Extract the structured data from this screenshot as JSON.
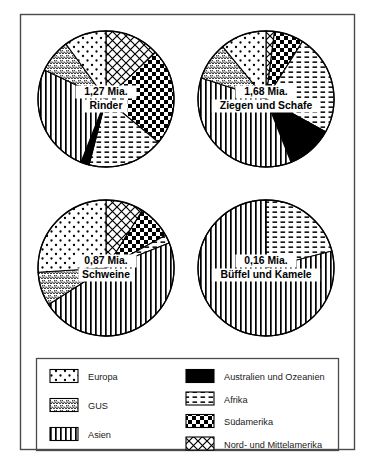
{
  "figure": {
    "unit_note": "Mia."
  },
  "chart_data": {
    "type": "pie",
    "legend_position": "bottom",
    "legend": [
      {
        "key": "europa",
        "label": "Europa",
        "pattern": "sparse-dots"
      },
      {
        "key": "gus",
        "label": "GUS",
        "pattern": "dense-scales"
      },
      {
        "key": "asien",
        "label": "Asien",
        "pattern": "vertical-lines"
      },
      {
        "key": "australien",
        "label": "Australien und Ozeanien",
        "pattern": "solid-black"
      },
      {
        "key": "afrika",
        "label": "Afrika",
        "pattern": "horizontal-dashes"
      },
      {
        "key": "suedamerika",
        "label": "Südamerika",
        "pattern": "checkerboard"
      },
      {
        "key": "nordamerika",
        "label": "Nord- und Mittelamerika",
        "pattern": "diagonal-crosshatch"
      }
    ],
    "charts": [
      {
        "id": "rinder",
        "value_label": "1,27 Mia.",
        "name_label": "Rinder",
        "value": 1.27,
        "categories": [
          "Nord- und Mittelamerika",
          "Südamerika",
          "Afrika",
          "Australien und Ozeanien",
          "Asien",
          "GUS",
          "Europa"
        ],
        "keys": [
          "nordamerika",
          "suedamerika",
          "afrika",
          "australien",
          "asien",
          "gus",
          "europa"
        ],
        "values": [
          13,
          23,
          18,
          2,
          26,
          8,
          10
        ]
      },
      {
        "id": "ziegen-schafe",
        "value_label": "1,68 Mia.",
        "name_label": "Ziegen und Schafe",
        "value": 1.68,
        "categories": [
          "Nord- und Mittelamerika",
          "Südamerika",
          "Afrika",
          "Australien und Ozeanien",
          "Asien",
          "GUS",
          "Europa"
        ],
        "keys": [
          "nordamerika",
          "suedamerika",
          "afrika",
          "australien",
          "asien",
          "gus",
          "europa"
        ],
        "values": [
          2,
          7,
          24,
          11,
          36,
          9,
          11
        ]
      },
      {
        "id": "schweine",
        "value_label": "0,87 Mia.",
        "name_label": "Schweine",
        "value": 0.87,
        "categories": [
          "Nord- und Mittelamerika",
          "Südamerika",
          "Afrika",
          "Australien und Ozeanien",
          "Asien",
          "GUS",
          "Europa"
        ],
        "keys": [
          "nordamerika",
          "suedamerika",
          "afrika",
          "australien",
          "asien",
          "gus",
          "europa"
        ],
        "values": [
          9,
          8,
          2,
          0,
          47,
          8,
          26
        ]
      },
      {
        "id": "bueffel-kamele",
        "value_label": "0,16 Mia.",
        "name_label": "Büffel und Kamele",
        "value": 0.16,
        "categories": [
          "Nord- und Mittelamerika",
          "Südamerika",
          "Afrika",
          "Australien und Ozeanien",
          "Asien",
          "GUS",
          "Europa"
        ],
        "keys": [
          "nordamerika",
          "suedamerika",
          "afrika",
          "australien",
          "asien",
          "gus",
          "europa"
        ],
        "values": [
          0,
          0,
          21,
          0,
          79,
          0,
          0
        ]
      }
    ]
  },
  "colors": {
    "ink": "#000000",
    "frame": "#4a4a4a",
    "paper": "#ffffff"
  }
}
